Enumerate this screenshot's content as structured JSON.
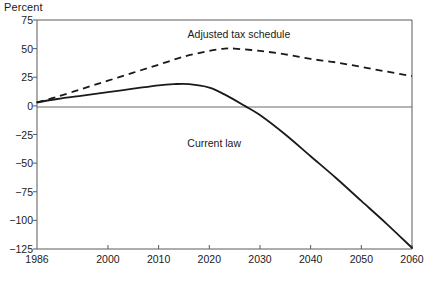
{
  "chart_data": {
    "type": "line",
    "title": "",
    "ylabel": "Percent",
    "xlabel": "",
    "xlim": [
      1986,
      2060
    ],
    "ylim": [
      -125,
      75
    ],
    "grid": false,
    "zero_line": true,
    "legend_position": "inline-annotations",
    "x_ticks": [
      "1986",
      "2000",
      "2010",
      "2020",
      "2030",
      "2040",
      "2050",
      "2060"
    ],
    "x_tick_values": [
      1986,
      2000,
      2010,
      2020,
      2030,
      2040,
      2050,
      2060
    ],
    "y_ticks": [
      "75",
      "50",
      "25",
      "0",
      "−25",
      "−50",
      "−75",
      "−100",
      "−125"
    ],
    "y_tick_values": [
      75,
      50,
      25,
      0,
      -25,
      -50,
      -75,
      -100,
      -125
    ],
    "series": [
      {
        "name": "Adjusted tax schedule",
        "style": "dashed",
        "color": "#1a1a1a",
        "label_x": 2024,
        "label_y": 62,
        "x": [
          1986,
          1990,
          1995,
          2000,
          2005,
          2010,
          2015,
          2020,
          2023,
          2025,
          2030,
          2035,
          2040,
          2045,
          2050,
          2055,
          2060
        ],
        "values": [
          3,
          8,
          15,
          22,
          29,
          36,
          43,
          48,
          50,
          50,
          48,
          45,
          41,
          38,
          34,
          30,
          26
        ]
      },
      {
        "name": "Current law",
        "style": "solid",
        "color": "#1a1a1a",
        "label_x": 2021,
        "label_y": -33,
        "x": [
          1986,
          1990,
          1995,
          2000,
          2005,
          2010,
          2013,
          2016,
          2020,
          2023,
          2027,
          2030,
          2035,
          2040,
          2045,
          2050,
          2055,
          2060
        ],
        "values": [
          3,
          6,
          9,
          12,
          15,
          18,
          19,
          19,
          16,
          10,
          0,
          -8,
          -25,
          -44,
          -63,
          -83,
          -103,
          -124
        ]
      }
    ]
  },
  "chart_text": {
    "y_axis_title": "Percent",
    "adjusted_label": "Adjusted tax schedule",
    "current_label": "Current law"
  },
  "colors": {
    "line": "#1a1a1a",
    "axis": "#555555",
    "background": "#ffffff"
  }
}
